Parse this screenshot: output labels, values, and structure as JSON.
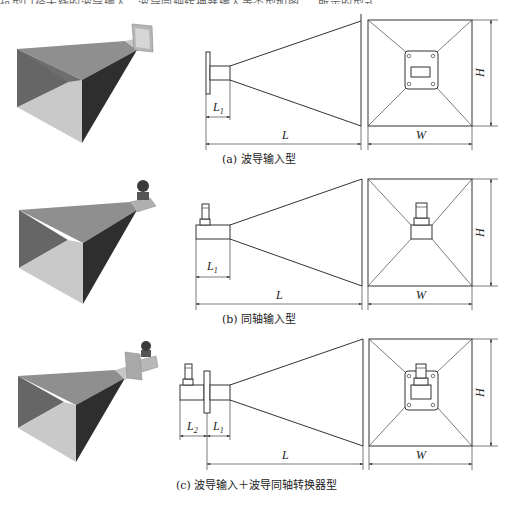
{
  "header_fragment": "抗型口径天线的波导输入、波导同轴转换器输入等类型如图 … 所示的型式。",
  "figure": {
    "panels": [
      {
        "id": "a",
        "caption": "(a) 波导输入型",
        "input_type": "waveguide-input",
        "dimensions": {
          "L1": "L",
          "L1_sub": "1",
          "L": "L",
          "W": "W",
          "H": "H"
        }
      },
      {
        "id": "b",
        "caption": "(b) 同轴输入型",
        "input_type": "coaxial-input",
        "dimensions": {
          "L1": "L",
          "L1_sub": "1",
          "L": "L",
          "W": "W",
          "H": "H"
        }
      },
      {
        "id": "c",
        "caption": "(c) 波导输入＋波导同轴转换器型",
        "input_type": "waveguide-input-with-coax-adapter",
        "dimensions": {
          "L2": "L",
          "L2_sub": "2",
          "L1": "L",
          "L1_sub": "1",
          "L": "L",
          "W": "W",
          "H": "H"
        }
      }
    ]
  }
}
